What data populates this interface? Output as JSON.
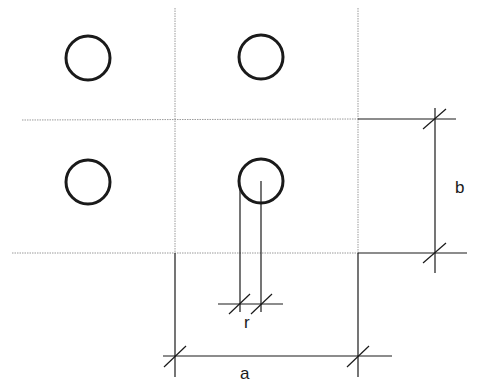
{
  "diagram": {
    "labels": {
      "a": "a",
      "b": "b",
      "r": "r"
    },
    "circles": [
      {
        "cx": 88,
        "cy": 58,
        "r": 22
      },
      {
        "cx": 261,
        "cy": 57,
        "r": 22
      },
      {
        "cx": 88,
        "cy": 182,
        "r": 22
      },
      {
        "cx": 261,
        "cy": 181,
        "r": 22
      }
    ],
    "colors": {
      "stroke": "#1a1a1a",
      "grid": "#9a9a9a",
      "background": "#ffffff"
    }
  }
}
